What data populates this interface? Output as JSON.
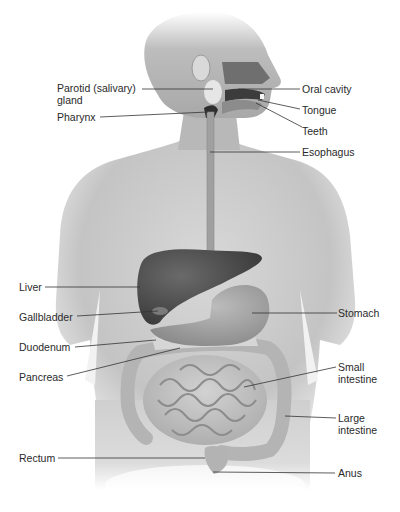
{
  "diagram": {
    "labels_left": [
      {
        "id": "parotid",
        "text_line1": "Parotid (salivary)",
        "text_line2": "gland"
      },
      {
        "id": "pharynx",
        "text": "Pharynx"
      },
      {
        "id": "liver",
        "text": "Liver"
      },
      {
        "id": "gallbladder",
        "text": "Gallbladder"
      },
      {
        "id": "duodenum",
        "text": "Duodenum"
      },
      {
        "id": "pancreas",
        "text": "Pancreas"
      },
      {
        "id": "rectum",
        "text": "Rectum"
      }
    ],
    "labels_right": [
      {
        "id": "oral_cavity",
        "text": "Oral cavity"
      },
      {
        "id": "tongue",
        "text": "Tongue"
      },
      {
        "id": "teeth",
        "text": "Teeth"
      },
      {
        "id": "esophagus",
        "text": "Esophagus"
      },
      {
        "id": "stomach",
        "text": "Stomach"
      },
      {
        "id": "small_intestine",
        "text_line1": "Small",
        "text_line2": "intestine"
      },
      {
        "id": "large_intestine",
        "text_line1": "Large",
        "text_line2": "intestine"
      },
      {
        "id": "anus",
        "text": "Anus"
      }
    ],
    "colors": {
      "skin_light": "#e6e6e6",
      "skin_mid": "#c9c9c9",
      "skin_dark": "#9a9a9a",
      "liver": "#4a4a4a",
      "organ": "#bdbdbd",
      "leader_line": "#333333",
      "text": "#2a2a2a"
    }
  }
}
